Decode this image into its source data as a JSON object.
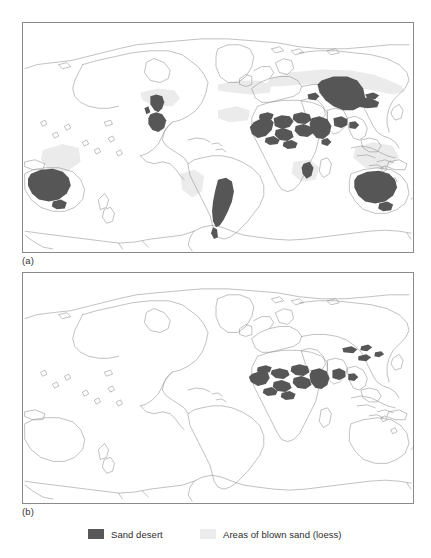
{
  "figure": {
    "panels": [
      {
        "id": "a",
        "label": "(a)",
        "caption_key": "panel-a",
        "shows": [
          "sand desert",
          "areas of blown sand (loess)"
        ]
      },
      {
        "id": "b",
        "label": "(b)",
        "caption_key": "panel-b",
        "shows": [
          "sand desert"
        ]
      }
    ]
  },
  "legend": {
    "entries": [
      {
        "label": "Sand desert",
        "swatch": "dark-gray-swatch",
        "color": "#585858"
      },
      {
        "label": "Areas of blown sand (loess)",
        "swatch": "light-gray-swatch",
        "color": "#ececec"
      }
    ]
  },
  "colors": {
    "sand_desert": "#565656",
    "loess": "#ebebeb",
    "coastline": "#8d8d8d",
    "frame": "#8a8a8a",
    "page_background": "#ffffff",
    "text": "#2d2d2d"
  },
  "map_data": {
    "type": "choropleth-world-map",
    "projection": "equirectangular-pacific-centred",
    "panel_a": {
      "sand_desert_regions": [
        "Great Basin / Sonoran (southwest North America)",
        "Patagonia / Monte (southern South America)",
        "Sahara (north Africa)",
        "Arabian Peninsula",
        "Iranian / Thar deserts",
        "Karakum / Kyzylkum (Central Asia)",
        "Taklamakan / Gobi (inner Asia)",
        "Great Sandy / Simpson / Great Victoria (Australia)",
        "Kalahari / Namib (southern Africa)"
      ],
      "loess_regions": [
        "Mid-latitude Eurasian belt",
        "Central North America",
        "Pampas (South America)",
        "North China",
        "Peripheral desert margins"
      ]
    },
    "panel_b": {
      "sand_desert_regions": [
        "Sahara (north Africa)",
        "Arabian Peninsula",
        "Iranian / Thar deserts",
        "Taklamakan / Gobi (inner Asia)"
      ],
      "loess_regions": []
    }
  }
}
